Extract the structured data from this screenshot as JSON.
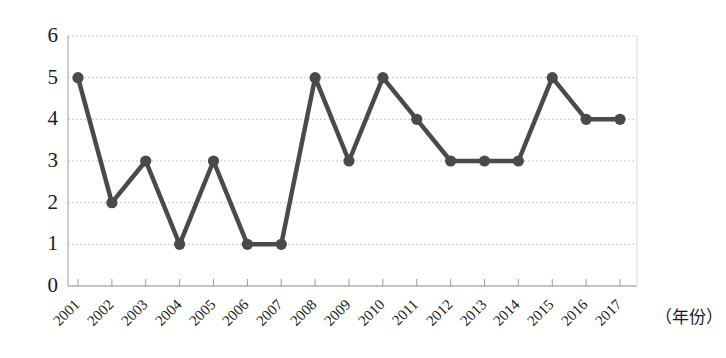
{
  "chart_data": {
    "type": "line",
    "title": "",
    "xlabel": "（年份）",
    "ylabel": "",
    "categories": [
      "2001",
      "2002",
      "2003",
      "2004",
      "2005",
      "2006",
      "2007",
      "2008",
      "2009",
      "2010",
      "2011",
      "2012",
      "2013",
      "2014",
      "2015",
      "2016",
      "2017"
    ],
    "values": [
      5,
      2,
      3,
      1,
      3,
      1,
      1,
      5,
      3,
      5,
      4,
      3,
      3,
      3,
      5,
      4,
      4
    ],
    "series": [
      {
        "name": "",
        "values": [
          5,
          2,
          3,
          1,
          3,
          1,
          1,
          5,
          3,
          5,
          4,
          3,
          3,
          3,
          5,
          4,
          4
        ]
      }
    ],
    "ylim": [
      0,
      6
    ],
    "ytick_labels": [
      "0",
      "1",
      "2",
      "3",
      "4",
      "5",
      "6"
    ],
    "ytick_values": [
      0,
      1,
      2,
      3,
      4,
      5,
      6
    ],
    "grid": true,
    "grid_axis": "y",
    "legend": "none",
    "marker": "circle",
    "line_color": "#4a4a4a",
    "marker_color": "#4a4a4a",
    "grid_color": "#c8c8c8",
    "axis_color": "#9a9a9a",
    "background_color": "#ffffff",
    "xtick_rotation": -45
  }
}
